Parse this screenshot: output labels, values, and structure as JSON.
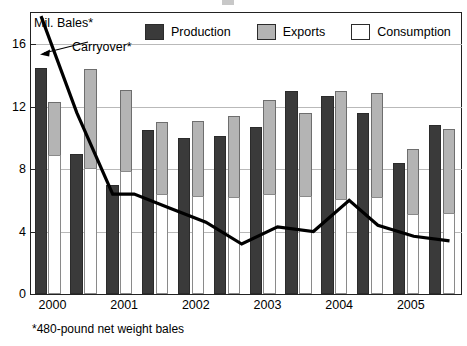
{
  "ylabel": "Mil. Bales*",
  "footnote": "*480-pound net weight bales",
  "annotation": {
    "label": "Carryover*",
    "icon": "arrow-left-icon"
  },
  "legend": {
    "position": "top",
    "items": [
      {
        "label": "Production",
        "color": "#3a3a3a",
        "swatch": "production-swatch"
      },
      {
        "label": "Exports",
        "color": "#b4b4b4",
        "swatch": "exports-swatch"
      },
      {
        "label": "Consumption",
        "color": "#ffffff",
        "swatch": "consumption-swatch"
      }
    ]
  },
  "axis": {
    "y_ticks": [
      "16",
      "12",
      "8",
      "4",
      "0"
    ],
    "x_ticks": [
      "2000",
      "2001",
      "2002",
      "2003",
      "2004",
      "2005"
    ]
  },
  "chart_data": {
    "type": "bar",
    "title": "Mil. Bales*",
    "xlabel": "",
    "ylabel": "Mil. Bales*",
    "ylim": [
      0,
      18
    ],
    "yticks": [
      0,
      4,
      8,
      12,
      16
    ],
    "grid": true,
    "legend_position": "top",
    "categories": [
      "2000 H1",
      "2000 H2",
      "2001 H1",
      "2001 H2",
      "2002 H1",
      "2002 H2",
      "2003 H1",
      "2003 H2",
      "2004 H1",
      "2004 H2",
      "2005 H1",
      "2005 H2"
    ],
    "x_tick_labels": [
      "2000",
      "2001",
      "2002",
      "2003",
      "2004",
      "2005"
    ],
    "series": [
      {
        "name": "Production",
        "color": "#3a3a3a",
        "values": [
          14.5,
          9.0,
          7.0,
          10.5,
          10.0,
          10.1,
          10.7,
          13.0,
          12.7,
          11.6,
          8.4,
          10.8
        ]
      },
      {
        "name": "Exports",
        "color": "#b4b4b4",
        "values": [
          12.3,
          14.4,
          13.1,
          11.0,
          11.1,
          11.4,
          12.4,
          11.6,
          13.0,
          12.9,
          9.3,
          10.6
        ]
      },
      {
        "name": "Consumption",
        "color": "#ffffff",
        "values": [
          8.9,
          8.1,
          7.9,
          6.4,
          6.3,
          6.2,
          6.4,
          6.3,
          6.1,
          6.2,
          5.1,
          5.2
        ]
      }
    ],
    "line_series": {
      "name": "Carryover*",
      "color": "#000000",
      "x": [
        0.0,
        1.0,
        2.0,
        2.6,
        3.6,
        4.6,
        5.6,
        6.6,
        7.6,
        8.6,
        9.4,
        10.4,
        11.4
      ],
      "values": [
        17.8,
        11.6,
        6.4,
        6.4,
        5.5,
        4.6,
        3.2,
        4.3,
        4.0,
        6.0,
        4.4,
        3.7,
        3.4
      ]
    }
  }
}
